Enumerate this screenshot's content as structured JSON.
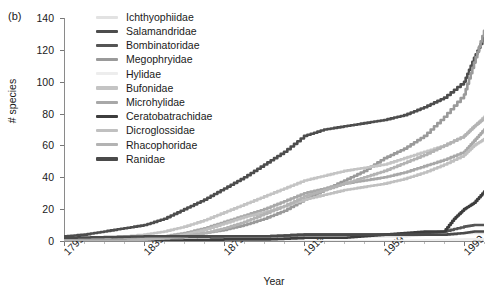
{
  "figure": {
    "panel_label": "(b)"
  },
  "chart_data": {
    "type": "line",
    "title": "",
    "xlabel": "Year",
    "ylabel": "# species",
    "xlim": [
      1799,
      2009
    ],
    "ylim": [
      0,
      140
    ],
    "xticks": [
      1799,
      1839,
      1879,
      1919,
      1959,
      1999
    ],
    "xtick_labels": [
      "1799",
      "1839",
      "1879",
      "1919",
      "1959",
      "1999"
    ],
    "yticks": [
      0,
      20,
      40,
      60,
      80,
      100,
      120,
      140
    ],
    "ytick_labels": [
      "0",
      "20",
      "40",
      "60",
      "80",
      "100",
      "120",
      "140"
    ],
    "grid": false,
    "legend_position": "top-center-inside",
    "series": [
      {
        "name": "Ichthyophiidae",
        "color": "#e2e2e2",
        "x": [
          1799,
          1829,
          1839,
          1859,
          1879,
          1899,
          1919,
          1939,
          1959,
          1969,
          1979,
          1989,
          1999,
          2009
        ],
        "values": [
          0,
          0,
          1,
          1,
          2,
          2,
          3,
          3,
          3,
          3,
          4,
          4,
          5,
          5
        ]
      },
      {
        "name": "Salamandridae",
        "color": "#4d4d4d",
        "x": [
          1799,
          1809,
          1819,
          1829,
          1839,
          1849,
          1859,
          1869,
          1879,
          1889,
          1899,
          1909,
          1919,
          1929,
          1939,
          1949,
          1959,
          1969,
          1979,
          1989,
          1999,
          2004,
          2009
        ],
        "values": [
          3,
          4,
          6,
          8,
          10,
          14,
          20,
          26,
          33,
          40,
          48,
          56,
          66,
          70,
          72,
          74,
          76,
          79,
          84,
          90,
          100,
          115,
          128
        ]
      },
      {
        "name": "Bombinatoridae",
        "color": "#555555",
        "x": [
          1799,
          1839,
          1879,
          1899,
          1919,
          1939,
          1959,
          1979,
          1989,
          1999,
          2004,
          2009
        ],
        "values": [
          1,
          2,
          3,
          3,
          4,
          4,
          4,
          5,
          6,
          9,
          10,
          10
        ]
      },
      {
        "name": "Megophryidae",
        "color": "#9a9a9a",
        "x": [
          1799,
          1829,
          1839,
          1849,
          1859,
          1869,
          1879,
          1889,
          1899,
          1909,
          1919,
          1929,
          1939,
          1949,
          1959,
          1969,
          1979,
          1989,
          1999,
          2004,
          2009
        ],
        "values": [
          0,
          0,
          1,
          2,
          3,
          5,
          7,
          10,
          14,
          19,
          26,
          32,
          38,
          44,
          52,
          58,
          66,
          78,
          92,
          112,
          132
        ]
      },
      {
        "name": "Hylidae",
        "color": "#ededed",
        "x": [
          1799,
          1839,
          1879,
          1919,
          1959,
          1999,
          2009
        ],
        "values": [
          0,
          0,
          0,
          0,
          0,
          1,
          1
        ]
      },
      {
        "name": "Bufonidae",
        "color": "#c4c4c4",
        "x": [
          1799,
          1819,
          1839,
          1849,
          1859,
          1869,
          1879,
          1889,
          1899,
          1909,
          1919,
          1929,
          1939,
          1949,
          1959,
          1969,
          1979,
          1989,
          1999,
          2004,
          2009
        ],
        "values": [
          1,
          2,
          4,
          6,
          9,
          13,
          18,
          23,
          28,
          33,
          38,
          41,
          44,
          46,
          48,
          52,
          56,
          60,
          66,
          72,
          78
        ]
      },
      {
        "name": "Microhylidae",
        "color": "#a8a8a8",
        "x": [
          1799,
          1829,
          1839,
          1849,
          1859,
          1869,
          1879,
          1889,
          1899,
          1909,
          1919,
          1929,
          1939,
          1949,
          1959,
          1969,
          1979,
          1989,
          1999,
          2004,
          2009
        ],
        "values": [
          0,
          1,
          2,
          3,
          5,
          8,
          12,
          16,
          20,
          25,
          30,
          33,
          36,
          38,
          40,
          43,
          47,
          51,
          56,
          63,
          70
        ]
      },
      {
        "name": "Ceratobatrachidae",
        "color": "#3d3d3d",
        "x": [
          1799,
          1839,
          1879,
          1899,
          1919,
          1939,
          1949,
          1959,
          1969,
          1979,
          1989,
          1994,
          1999,
          2004,
          2009
        ],
        "values": [
          0,
          0,
          1,
          1,
          2,
          2,
          3,
          4,
          5,
          6,
          6,
          14,
          20,
          24,
          31
        ]
      },
      {
        "name": "Dicroglossidae",
        "color": "#c0c0c0",
        "x": [
          1799,
          1829,
          1839,
          1849,
          1859,
          1869,
          1879,
          1889,
          1899,
          1909,
          1919,
          1929,
          1939,
          1949,
          1959,
          1969,
          1979,
          1989,
          1999,
          2004,
          2009
        ],
        "values": [
          0,
          0,
          1,
          2,
          4,
          7,
          11,
          15,
          18,
          22,
          26,
          29,
          32,
          34,
          36,
          39,
          43,
          48,
          54,
          60,
          64
        ]
      },
      {
        "name": "Rhacophoridae",
        "color": "#b3b3b3",
        "x": [
          1799,
          1829,
          1839,
          1849,
          1859,
          1869,
          1879,
          1889,
          1899,
          1909,
          1919,
          1929,
          1939,
          1949,
          1959,
          1969,
          1979,
          1989,
          1999,
          2004,
          2009
        ],
        "values": [
          0,
          0,
          1,
          2,
          3,
          5,
          8,
          12,
          17,
          22,
          28,
          32,
          36,
          40,
          44,
          49,
          54,
          60,
          66,
          72,
          77
        ]
      },
      {
        "name": "Ranidae",
        "color": "#4a4a4a",
        "x": [
          1799,
          1839,
          1879,
          1899,
          1919,
          1939,
          1959,
          1979,
          1989,
          1999,
          2004,
          2009
        ],
        "values": [
          2,
          3,
          3,
          3,
          4,
          4,
          4,
          4,
          4,
          5,
          6,
          6
        ]
      }
    ]
  }
}
